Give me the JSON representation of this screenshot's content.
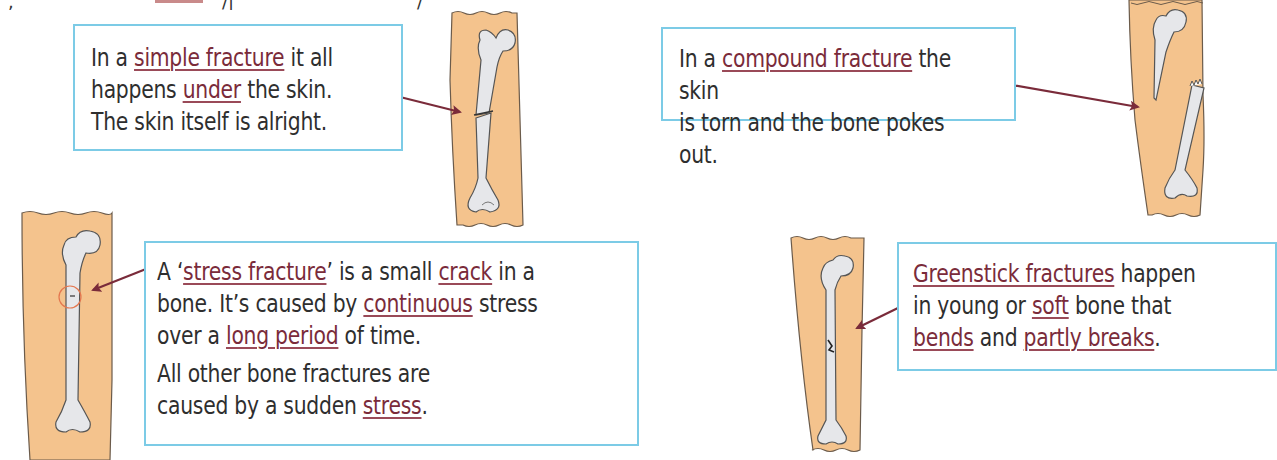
{
  "page": {
    "topic": "Bone fractures",
    "top_strip_partial_text": ", ... ... ... ... type ... ... ... ..."
  },
  "colors": {
    "box_border": "#7ccbe6",
    "keyword": "#7a2b3a",
    "arrow": "#7a2b3a",
    "skin": "#f4c38d",
    "skin_outline": "#6b5b4b",
    "bone": "#e6e7ea",
    "bone_shade": "#b9bcc2",
    "highlight_circle": "#e4774f"
  },
  "panels": {
    "simple": {
      "lines": [
        {
          "pre": "In a ",
          "key": "simple fracture",
          "post": " it all"
        },
        {
          "pre": "happens ",
          "key": "under",
          "post": " the skin."
        },
        {
          "pre": "The skin itself is alright.",
          "key": "",
          "post": ""
        }
      ],
      "illustration": "simple-fracture-femur"
    },
    "compound": {
      "lines": [
        {
          "pre": "In a ",
          "key": "compound fracture",
          "post": " the skin"
        },
        {
          "pre": "is torn and the bone pokes out.",
          "key": "",
          "post": ""
        }
      ],
      "illustration": "compound-fracture-femur"
    },
    "stress": {
      "line1": {
        "pre": "A ‘",
        "key1": "stress fracture",
        "mid": "’ is a small ",
        "key2": "crack",
        "post": " in a"
      },
      "line2": {
        "pre": "bone.  It’s caused by ",
        "key": "continuous",
        "post": " stress"
      },
      "line3": {
        "pre": "over a ",
        "key": "long period",
        "post": " of time."
      },
      "line4": {
        "text": "All other bone fractures are"
      },
      "line5": {
        "pre": "caused by a sudden ",
        "key": "stress",
        "post": "."
      },
      "illustration": "stress-fracture-femur"
    },
    "greenstick": {
      "line1": {
        "key": "Greenstick fractures",
        "post": " happen"
      },
      "line2": {
        "pre": "in young or ",
        "key": "soft",
        "post": " bone that"
      },
      "line3": {
        "key1": "bends",
        "mid": " and ",
        "key2": "partly breaks",
        "post": "."
      },
      "illustration": "greenstick-fracture-femur"
    }
  }
}
